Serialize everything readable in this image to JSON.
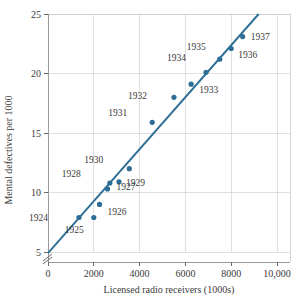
{
  "chart_data": {
    "type": "scatter",
    "title": "",
    "xlabel": "Licensed radio receivers (1000s)",
    "ylabel": "Mental defectives per 1000",
    "xlim": [
      0,
      10000
    ],
    "ylim": [
      5,
      25
    ],
    "grid": true,
    "legend": "none",
    "y_axis_break": true,
    "xticks": [
      0,
      2000,
      4000,
      6000,
      8000,
      10000
    ],
    "xtick_labels": [
      "0",
      "2000",
      "4000",
      "6000",
      "8000",
      "10,000"
    ],
    "yticks": [
      5,
      10,
      15,
      20,
      25
    ],
    "ytick_labels": [
      "5",
      "10",
      "15",
      "20",
      "25"
    ],
    "point_color": "#2e6e96",
    "line_color": "#2e6e96",
    "grid_color": "#d8d8d8",
    "fit_line": {
      "x": [
        0,
        9200
      ],
      "y": [
        4.9,
        25.0
      ]
    },
    "points": [
      {
        "label": "1924",
        "x": 1350,
        "y": 7.9,
        "lx": -31,
        "ly": 4
      },
      {
        "label": "1925",
        "x": 2000,
        "y": 7.9,
        "lx": -10,
        "ly": 16
      },
      {
        "label": "1926",
        "x": 2250,
        "y": 9.0,
        "lx": 8,
        "ly": 11
      },
      {
        "label": "1927",
        "x": 2600,
        "y": 10.3,
        "lx": 9,
        "ly": 1
      },
      {
        "label": "1928",
        "x": 2700,
        "y": 10.8,
        "lx": -29,
        "ly": -6
      },
      {
        "label": "1929",
        "x": 3100,
        "y": 10.9,
        "lx": 7,
        "ly": 4
      },
      {
        "label": "1930",
        "x": 3550,
        "y": 12.0,
        "lx": -26,
        "ly": -6
      },
      {
        "label": "1931",
        "x": 4550,
        "y": 15.9,
        "lx": -25,
        "ly": -6
      },
      {
        "label": "1932",
        "x": 5500,
        "y": 18.0,
        "lx": -27,
        "ly": 2
      },
      {
        "label": "1933",
        "x": 6250,
        "y": 19.1,
        "lx": 8,
        "ly": 9
      },
      {
        "label": "1934",
        "x": 6900,
        "y": 20.1,
        "lx": -20,
        "ly": -11
      },
      {
        "label": "1935",
        "x": 7500,
        "y": 21.2,
        "lx": -14,
        "ly": -9
      },
      {
        "label": "1936",
        "x": 8000,
        "y": 22.1,
        "lx": 7,
        "ly": 9
      },
      {
        "label": "1937",
        "x": 8500,
        "y": 23.1,
        "lx": 8,
        "ly": 3
      }
    ]
  }
}
